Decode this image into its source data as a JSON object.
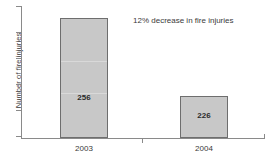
{
  "chart_data": {
    "type": "bar",
    "title": "",
    "subtitle": "",
    "xlabel": "",
    "ylabel": "Number of fire injuries",
    "categories": [
      "2003",
      "2004"
    ],
    "values": [
      256,
      226
    ],
    "series": [
      {
        "name": "Number of fire injuries",
        "values": [
          256,
          226
        ]
      }
    ],
    "data_labels": [
      "256",
      "226"
    ],
    "annotations": [
      {
        "text": "12% decrease in fire injuries",
        "x": "2003-2004",
        "position": "top-right"
      }
    ],
    "ylim": [
      0,
      290
    ],
    "y_tick_labels": [],
    "x_tick_labels": [
      "2003",
      "2004"
    ],
    "grid": false,
    "legend": false,
    "legend_position": "none",
    "orientation": "vertical",
    "colors": {
      "bar_fill": "#c8c8c8",
      "bar_border": "#6e6e6e",
      "axis": "#8a8a8a",
      "text": "#3a3a3a",
      "value_text": "#2b2b2b",
      "background": "#ffffff",
      "bar_gridline": "#d9d9d9"
    }
  },
  "axis": {
    "y_title": "Number of fire injuries",
    "y_tick_count": 6,
    "x_tick_count": 1
  },
  "bars": [
    {
      "category": "2003",
      "value": 256,
      "label": "256",
      "left": 60,
      "width": 48,
      "top": 18,
      "height": 120,
      "value_label_top": 74,
      "gridlines": [
        42,
        74
      ]
    },
    {
      "category": "2004",
      "value": 226,
      "label": "226",
      "left": 180,
      "width": 48,
      "top": 96,
      "height": 42,
      "value_label_top": 14,
      "gridlines": []
    }
  ],
  "x_labels": [
    {
      "text": "2003",
      "left": 54
    },
    {
      "text": "2004",
      "left": 174
    }
  ],
  "annotation": {
    "text": "12% decrease in fire injuries"
  },
  "y_ticks": [
    6,
    32,
    58,
    84,
    110,
    136
  ],
  "x_ticks": [
    142
  ],
  "x_axis_endcaps": [
    21,
    264
  ]
}
